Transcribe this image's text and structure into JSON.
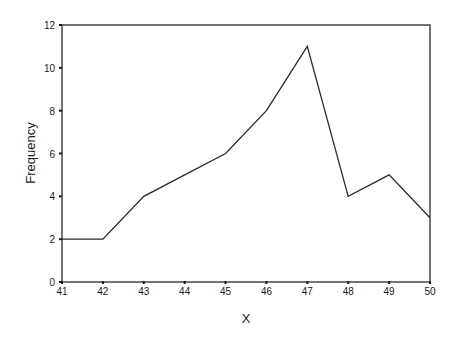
{
  "chart_data": {
    "type": "line",
    "title": "",
    "xlabel": "X",
    "ylabel": "Frequency",
    "x": [
      41,
      42,
      43,
      44,
      45,
      46,
      47,
      48,
      49,
      50
    ],
    "series": [
      {
        "name": "Frequency",
        "values": [
          2,
          2,
          4,
          5,
          6,
          8,
          11,
          4,
          5,
          3
        ]
      }
    ],
    "xlim": [
      41,
      50
    ],
    "ylim": [
      0,
      12
    ],
    "xticks": [
      "41",
      "42",
      "43",
      "44",
      "45",
      "46",
      "47",
      "48",
      "49",
      "50"
    ],
    "yticks": [
      "0",
      "2",
      "4",
      "6",
      "8",
      "10",
      "12"
    ],
    "grid": false,
    "legend": "none",
    "line_color": "#2a2a2a"
  },
  "layout": {
    "plot_left": 62,
    "plot_right": 430,
    "plot_top": 25,
    "plot_bottom": 282
  }
}
